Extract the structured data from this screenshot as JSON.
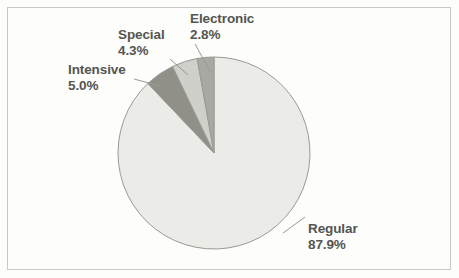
{
  "chart_data": {
    "type": "pie",
    "title": "",
    "categories": [
      "Electronic",
      "Special",
      "Intensive",
      "Regular"
    ],
    "values": [
      2.8,
      4.3,
      5.0,
      87.9
    ],
    "value_labels": [
      "2.8%",
      "4.3%",
      "5.0%",
      "87.9%"
    ],
    "unit": "%",
    "start_angle_deg": 0,
    "direction": "counterclockwise",
    "legend": "none",
    "labels_position": "outside-with-leader-lines",
    "slice_colors": [
      "#a9a9a4",
      "#d0d0cb",
      "#909089",
      "#ebebe7"
    ],
    "slice_border_color": "#9a9a94",
    "series": [
      {
        "name": "Share of volume",
        "values": [
          2.8,
          4.3,
          5.0,
          87.9
        ]
      }
    ],
    "slices": [
      {
        "label": "Electronic",
        "value_label": "2.8%",
        "value": 2.8,
        "color": "#a9a9a4"
      },
      {
        "label": "Special",
        "value_label": "4.3%",
        "value": 4.3,
        "color": "#d0d0cb"
      },
      {
        "label": "Intensive",
        "value_label": "5.0%",
        "value": 5.0,
        "color": "#909089"
      },
      {
        "label": "Regular",
        "value_label": "87.9%",
        "value": 87.9,
        "color": "#ebebe7"
      }
    ]
  },
  "colors": {
    "background": "#fdfdfc",
    "frame_border": "#c9c9c4",
    "text": "#555550",
    "leader_line": "#9a9a94"
  }
}
